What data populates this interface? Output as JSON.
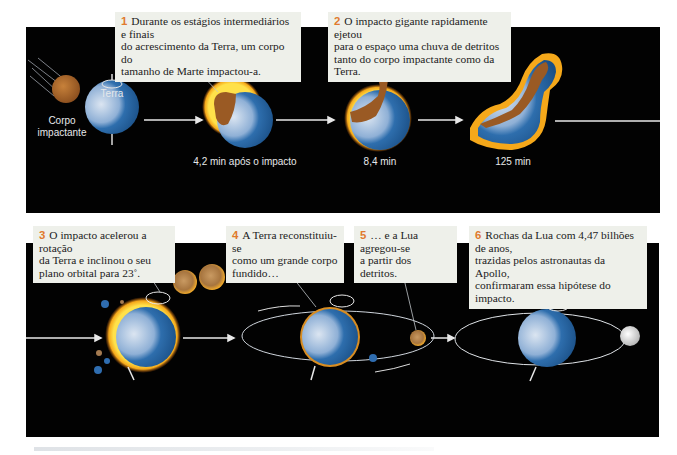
{
  "figure": {
    "callouts": [
      {
        "number": "1",
        "text": "Durante os estágios intermediários e finais\ndo acrescimento da Terra, um corpo do\ntamanho de Marte impactou-a."
      },
      {
        "number": "2",
        "text": "O impacto gigante rapidamente ejetou\npara o espaço uma chuva de detritos\ntanto do corpo impactante como da Terra."
      },
      {
        "number": "3",
        "text": "O impacto acelerou a rotação\nda Terra e inclinou o seu\nplano orbital para 23˚."
      },
      {
        "number": "4",
        "text": "A Terra reconstituiu-se\ncomo um grande corpo\nfundido…"
      },
      {
        "number": "5",
        "text": "… e a Lua agregou-se\na partir dos detritos."
      },
      {
        "number": "6",
        "text": "Rochas da Lua com 4,47 bilhões de anos,\ntrazidas pelos astronautas da Apollo,\nconfirmaram essa hipótese do impacto."
      }
    ],
    "labels": {
      "impactor": "Corpo\nimpactante",
      "earth": "Terra",
      "t1": "4,2 min após o impacto",
      "t2": "8,4 min",
      "t3": "125 min"
    },
    "colors": {
      "background": "#020202",
      "callout_bg": "#eef0ea",
      "number_accent": "#e07a2e",
      "earth_light": "#c9d8ea",
      "earth_dark": "#1f5f9e",
      "impactor": "#b06a2c",
      "glow": "#f5c21a"
    }
  }
}
